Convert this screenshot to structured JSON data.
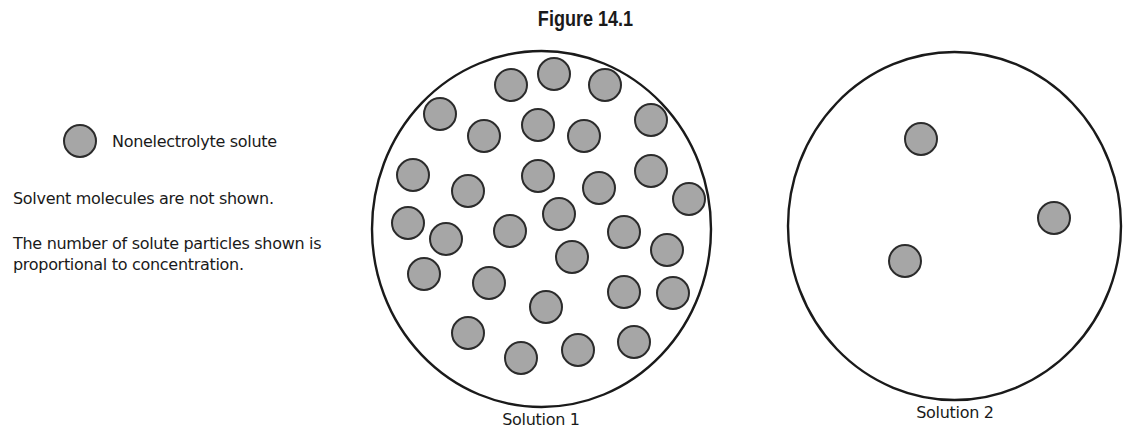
{
  "figure": {
    "title": "Figure 14.1"
  },
  "legend": {
    "symbol": "gray-filled-circle",
    "label": "Nonelectrolyte solute"
  },
  "notes": [
    "Solvent molecules are not shown.",
    "The number of solute particles shown is proportional to concentration."
  ],
  "colors": {
    "particle_fill": "#a6a6a6",
    "particle_stroke": "#2b2b2b",
    "container_stroke": "#1a1a1a",
    "background": "#ffffff"
  },
  "solutions": [
    {
      "label": "Solution 1",
      "solute_particle_count": 30
    },
    {
      "label": "Solution 2",
      "solute_particle_count": 3
    }
  ]
}
